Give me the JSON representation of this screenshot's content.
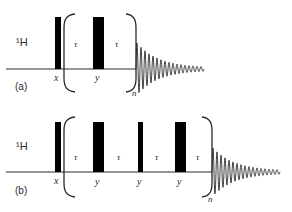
{
  "figure": {
    "colors": {
      "ink": "#2a2a2a",
      "pulse": "#000000",
      "background": "#ffffff"
    },
    "panels": [
      {
        "id": "a",
        "label": "(a)",
        "nucleus": "1H",
        "nucleus_display": "¹H",
        "repeat_label": "n",
        "baseline_y": 69,
        "pulse_top": 17,
        "pulses": [
          {
            "phase": "x",
            "x0": 55,
            "x1": 61,
            "type": "90"
          },
          {
            "phase": "y",
            "x0": 93,
            "x1": 104,
            "type": "180"
          }
        ],
        "delays": [
          {
            "label": "τ",
            "x": 76
          },
          {
            "label": "τ",
            "x": 117
          }
        ],
        "bracket": {
          "left_x": 69,
          "right_x": 130,
          "top": 14,
          "bottom": 92
        },
        "fid": {
          "x_start": 136,
          "x_end": 204,
          "amp": 26
        }
      },
      {
        "id": "b",
        "label": "(b)",
        "nucleus": "1H",
        "nucleus_display": "¹H",
        "repeat_label": "n",
        "baseline_y": 172,
        "pulse_top": 122,
        "pulses": [
          {
            "phase": "x",
            "x0": 55,
            "x1": 61,
            "type": "90"
          },
          {
            "phase": "y",
            "x0": 93,
            "x1": 104,
            "type": "180"
          },
          {
            "phase": "y",
            "x0": 138,
            "x1": 143,
            "type": "90"
          },
          {
            "phase": "y",
            "x0": 175,
            "x1": 186,
            "type": "180"
          }
        ],
        "delays": [
          {
            "label": "τ",
            "x": 76
          },
          {
            "label": "τ",
            "x": 119
          },
          {
            "label": "τ",
            "x": 157
          },
          {
            "label": "τ",
            "x": 198
          }
        ],
        "bracket": {
          "left_x": 69,
          "right_x": 206,
          "top": 117,
          "bottom": 197
        },
        "fid": {
          "x_start": 212,
          "x_end": 280,
          "amp": 24
        }
      }
    ]
  }
}
